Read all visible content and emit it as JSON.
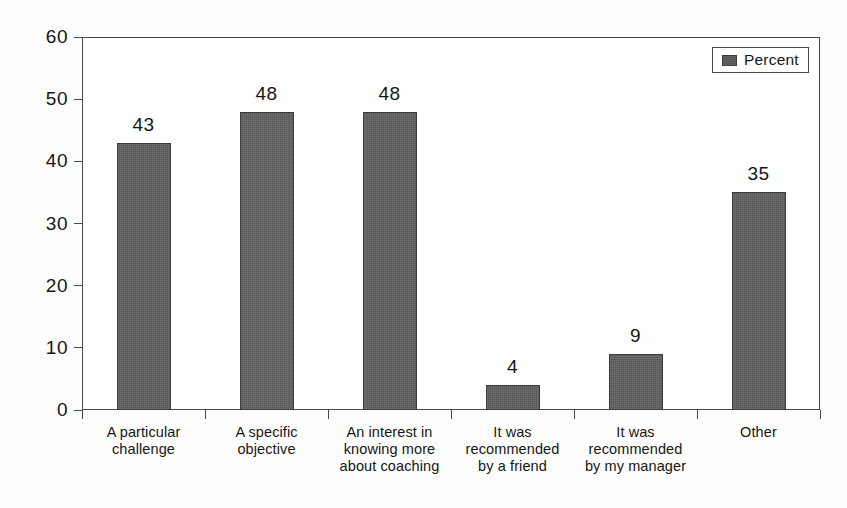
{
  "chart_data": {
    "type": "bar",
    "title": "",
    "xlabel": "",
    "ylabel": "",
    "ylim": [
      0,
      60
    ],
    "ytick_values": [
      0,
      10,
      20,
      30,
      40,
      50,
      60
    ],
    "ytick_labels": [
      "0",
      "10",
      "20",
      "30",
      "40",
      "50",
      "60"
    ],
    "grid": true,
    "legend_position": "top-right",
    "categories": [
      "A particular challenge",
      "A specific objective",
      "An interest in knowing more about coaching",
      "It was recommended by a friend",
      "It was recommended by my manager",
      "Other"
    ],
    "category_lines": [
      [
        "A particular",
        "challenge"
      ],
      [
        "A specific",
        "objective"
      ],
      [
        "An interest in",
        "knowing more",
        "about coaching"
      ],
      [
        "It was",
        "recommended",
        "by a friend"
      ],
      [
        "It was",
        "recommended",
        "by my manager"
      ],
      [
        "Other"
      ]
    ],
    "series": [
      {
        "name": "Percent",
        "values": [
          43,
          48,
          48,
          4,
          9,
          35
        ],
        "value_labels": [
          "43",
          "48",
          "48",
          "4",
          "9",
          "35"
        ],
        "color": "#595959"
      }
    ]
  },
  "legend": {
    "entries": [
      {
        "label": "Percent",
        "swatch_color": "#555555"
      }
    ]
  },
  "colors": {
    "bar_fill": "#595959",
    "bar_edge": "#3b3b3b",
    "axis": "#4a4a4a",
    "gridline": "#6d6d6d",
    "text": "#161616",
    "background": "#ffffff"
  }
}
